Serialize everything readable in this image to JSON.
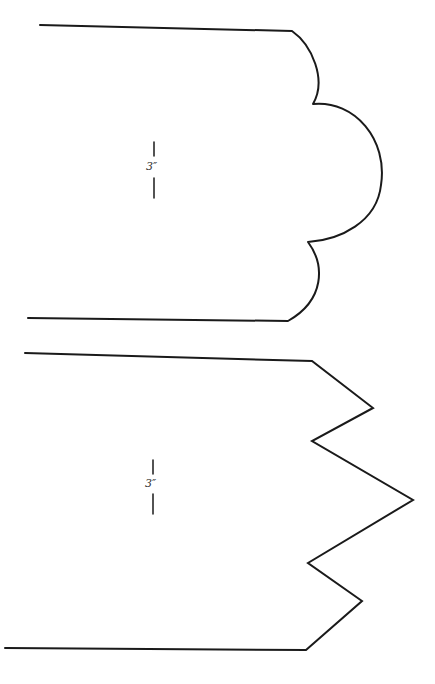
{
  "diagram": {
    "title": "",
    "shapes": [
      {
        "name": "scalloped-edge-template",
        "edge_type": "scalloped",
        "dimension_label": "3″",
        "stroke_color": "#1a1a1a"
      },
      {
        "name": "zigzag-edge-template",
        "edge_type": "zigzag",
        "dimension_label": "3″",
        "stroke_color": "#1a1a1a"
      }
    ]
  }
}
